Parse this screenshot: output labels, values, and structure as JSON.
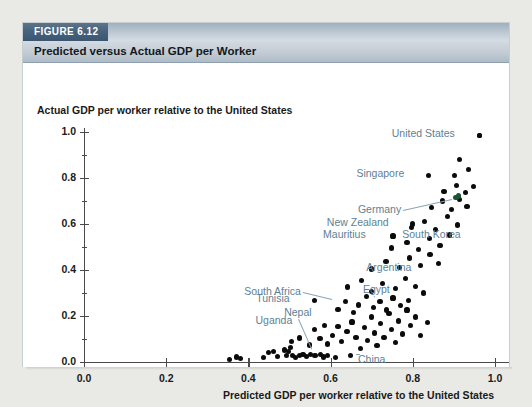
{
  "figure": {
    "tab_label": "FIGURE 6.12",
    "title": "Predicted versus Actual GDP per Worker"
  },
  "chart_data": {
    "type": "scatter",
    "title": "Predicted versus Actual GDP per Worker",
    "xlabel": "Predicted GDP per worker relative to the United States",
    "ylabel": "Actual GDP per worker relative to the United States",
    "xlim": [
      0.0,
      1.05
    ],
    "ylim": [
      0.0,
      1.05
    ],
    "xticks": [
      "0.0",
      "0.2",
      "0.4",
      "0.6",
      "0.8",
      "1.0"
    ],
    "xtick_values": [
      0.0,
      0.2,
      0.4,
      0.6,
      0.8,
      1.0
    ],
    "yticks": [
      "0.0",
      "0.2",
      "0.4",
      "0.6",
      "0.8",
      "1.0"
    ],
    "ytick_values": [
      0.0,
      0.2,
      0.4,
      0.6,
      0.8,
      1.0
    ],
    "minor_ticks": true,
    "grid": false,
    "legend": null,
    "point_color": "#0b0b0b",
    "label_color": "#5d7f94",
    "points": [
      {
        "x": 0.355,
        "y": 0.01
      },
      {
        "x": 0.372,
        "y": 0.022
      },
      {
        "x": 0.38,
        "y": 0.016
      },
      {
        "x": 0.437,
        "y": 0.018
      },
      {
        "x": 0.449,
        "y": 0.04
      },
      {
        "x": 0.462,
        "y": 0.046
      },
      {
        "x": 0.47,
        "y": 0.024
      },
      {
        "x": 0.487,
        "y": 0.052
      },
      {
        "x": 0.492,
        "y": 0.03
      },
      {
        "x": 0.498,
        "y": 0.044
      },
      {
        "x": 0.503,
        "y": 0.062
      },
      {
        "x": 0.507,
        "y": 0.03
      },
      {
        "x": 0.515,
        "y": 0.018
      },
      {
        "x": 0.524,
        "y": 0.03
      },
      {
        "x": 0.533,
        "y": 0.034
      },
      {
        "x": 0.542,
        "y": 0.024
      },
      {
        "x": 0.551,
        "y": 0.032
      },
      {
        "x": 0.562,
        "y": 0.028
      },
      {
        "x": 0.575,
        "y": 0.034
      },
      {
        "x": 0.583,
        "y": 0.022
      },
      {
        "x": 0.593,
        "y": 0.03
      },
      {
        "x": 0.612,
        "y": 0.02
      },
      {
        "x": 0.648,
        "y": 0.028
      },
      {
        "x": 0.505,
        "y": 0.088
      },
      {
        "x": 0.524,
        "y": 0.104
      },
      {
        "x": 0.548,
        "y": 0.074
      },
      {
        "x": 0.56,
        "y": 0.142
      },
      {
        "x": 0.574,
        "y": 0.102
      },
      {
        "x": 0.586,
        "y": 0.16
      },
      {
        "x": 0.592,
        "y": 0.078
      },
      {
        "x": 0.604,
        "y": 0.116
      },
      {
        "x": 0.618,
        "y": 0.154
      },
      {
        "x": 0.627,
        "y": 0.09
      },
      {
        "x": 0.64,
        "y": 0.132
      },
      {
        "x": 0.652,
        "y": 0.174
      },
      {
        "x": 0.662,
        "y": 0.108
      },
      {
        "x": 0.673,
        "y": 0.06
      },
      {
        "x": 0.682,
        "y": 0.15
      },
      {
        "x": 0.69,
        "y": 0.094
      },
      {
        "x": 0.7,
        "y": 0.196
      },
      {
        "x": 0.706,
        "y": 0.126
      },
      {
        "x": 0.713,
        "y": 0.07
      },
      {
        "x": 0.722,
        "y": 0.166
      },
      {
        "x": 0.73,
        "y": 0.108
      },
      {
        "x": 0.742,
        "y": 0.21
      },
      {
        "x": 0.748,
        "y": 0.14
      },
      {
        "x": 0.757,
        "y": 0.086
      },
      {
        "x": 0.766,
        "y": 0.178
      },
      {
        "x": 0.775,
        "y": 0.122
      },
      {
        "x": 0.786,
        "y": 0.226
      },
      {
        "x": 0.795,
        "y": 0.158
      },
      {
        "x": 0.806,
        "y": 0.196
      },
      {
        "x": 0.818,
        "y": 0.116
      },
      {
        "x": 0.836,
        "y": 0.172
      },
      {
        "x": 0.618,
        "y": 0.23
      },
      {
        "x": 0.636,
        "y": 0.262
      },
      {
        "x": 0.655,
        "y": 0.214
      },
      {
        "x": 0.668,
        "y": 0.248
      },
      {
        "x": 0.688,
        "y": 0.284
      },
      {
        "x": 0.704,
        "y": 0.236
      },
      {
        "x": 0.72,
        "y": 0.262
      },
      {
        "x": 0.736,
        "y": 0.226
      },
      {
        "x": 0.752,
        "y": 0.278
      },
      {
        "x": 0.771,
        "y": 0.244
      },
      {
        "x": 0.79,
        "y": 0.268
      },
      {
        "x": 0.642,
        "y": 0.326
      },
      {
        "x": 0.676,
        "y": 0.354
      },
      {
        "x": 0.7,
        "y": 0.306
      },
      {
        "x": 0.727,
        "y": 0.34
      },
      {
        "x": 0.758,
        "y": 0.318
      },
      {
        "x": 0.782,
        "y": 0.362
      },
      {
        "x": 0.806,
        "y": 0.33
      },
      {
        "x": 0.826,
        "y": 0.3
      },
      {
        "x": 0.7,
        "y": 0.404
      },
      {
        "x": 0.735,
        "y": 0.436
      },
      {
        "x": 0.768,
        "y": 0.41
      },
      {
        "x": 0.792,
        "y": 0.452
      },
      {
        "x": 0.818,
        "y": 0.418
      },
      {
        "x": 0.842,
        "y": 0.466
      },
      {
        "x": 0.862,
        "y": 0.428
      },
      {
        "x": 0.748,
        "y": 0.496
      },
      {
        "x": 0.786,
        "y": 0.52
      },
      {
        "x": 0.814,
        "y": 0.488
      },
      {
        "x": 0.84,
        "y": 0.538
      },
      {
        "x": 0.866,
        "y": 0.506
      },
      {
        "x": 0.89,
        "y": 0.552
      },
      {
        "x": 0.796,
        "y": 0.584
      },
      {
        "x": 0.828,
        "y": 0.612
      },
      {
        "x": 0.856,
        "y": 0.576
      },
      {
        "x": 0.884,
        "y": 0.634
      },
      {
        "x": 0.908,
        "y": 0.596
      },
      {
        "x": 0.846,
        "y": 0.672
      },
      {
        "x": 0.872,
        "y": 0.7
      },
      {
        "x": 0.894,
        "y": 0.664
      },
      {
        "x": 0.914,
        "y": 0.706
      },
      {
        "x": 0.932,
        "y": 0.676
      },
      {
        "x": 0.876,
        "y": 0.742
      },
      {
        "x": 0.906,
        "y": 0.768
      },
      {
        "x": 0.928,
        "y": 0.736
      },
      {
        "x": 0.948,
        "y": 0.762
      },
      {
        "x": 0.902,
        "y": 0.812
      },
      {
        "x": 0.936,
        "y": 0.836
      },
      {
        "x": 0.914,
        "y": 0.88
      },
      {
        "x": 0.963,
        "y": 0.985
      },
      {
        "x": 0.905,
        "y": 0.714,
        "color": "greenish"
      },
      {
        "x": 0.912,
        "y": 0.722,
        "color": "greenish"
      }
    ],
    "annotations": [
      {
        "label": "United States",
        "x": 0.963,
        "y": 0.985,
        "dot": true,
        "leader": false
      },
      {
        "label": "Singapore",
        "x": 0.838,
        "y": 0.812,
        "dot": true,
        "leader": false
      },
      {
        "label": "Germany",
        "x": 0.905,
        "y": 0.714,
        "dot": false,
        "leader": true
      },
      {
        "label": "New Zealand",
        "x": 0.8,
        "y": 0.6,
        "dot": true,
        "leader": false
      },
      {
        "label": "Mauritius",
        "x": 0.752,
        "y": 0.548,
        "dot": true,
        "leader": false
      },
      {
        "label": "South Korea",
        "x": 0.862,
        "y": 0.548,
        "dot": false,
        "leader": false
      },
      {
        "label": "Argentina",
        "x": 0.76,
        "y": 0.4,
        "dot": false,
        "leader": false
      },
      {
        "label": "South Africa",
        "x": 0.614,
        "y": 0.268,
        "dot": false,
        "leader": true
      },
      {
        "label": "Egypt",
        "x": 0.698,
        "y": 0.276,
        "dot": false,
        "leader": true
      },
      {
        "label": "Tunisia",
        "x": 0.56,
        "y": 0.268,
        "dot": true,
        "leader": false
      },
      {
        "label": "Nepal",
        "x": 0.56,
        "y": 0.04,
        "dot": false,
        "leader": true
      },
      {
        "label": "Uganda",
        "x": 0.5,
        "y": 0.1,
        "dot": false,
        "leader": false
      },
      {
        "label": "China",
        "x": 0.652,
        "y": 0.03,
        "dot": false,
        "leader": true
      }
    ]
  }
}
